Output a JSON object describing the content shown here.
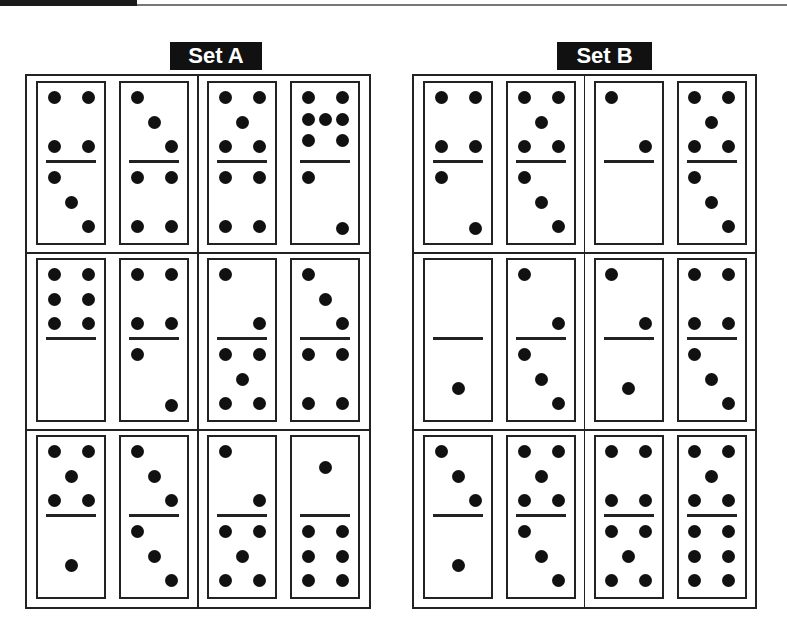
{
  "header": {
    "bar": "top-border"
  },
  "sets": [
    {
      "label": "Set A",
      "rows": [
        [
          {
            "top": 4,
            "bottom": 3
          },
          {
            "top": 3,
            "bottom": 4
          },
          {
            "top": 5,
            "bottom": 4
          },
          {
            "top": 7,
            "bottom": 2
          }
        ],
        [
          {
            "top": 6,
            "bottom": 0
          },
          {
            "top": 4,
            "bottom": 2
          },
          {
            "top": 2,
            "bottom": 5
          },
          {
            "top": 3,
            "bottom": 4
          }
        ],
        [
          {
            "top": 5,
            "bottom": 1
          },
          {
            "top": 3,
            "bottom": 3
          },
          {
            "top": 2,
            "bottom": 5
          },
          {
            "top": 1,
            "bottom": 6
          }
        ]
      ]
    },
    {
      "label": "Set B",
      "rows": [
        [
          {
            "top": 4,
            "bottom": 2
          },
          {
            "top": 5,
            "bottom": 3
          },
          {
            "top": 2,
            "bottom": 0
          },
          {
            "top": 5,
            "bottom": 3
          }
        ],
        [
          {
            "top": 0,
            "bottom": 1
          },
          {
            "top": 2,
            "bottom": 3
          },
          {
            "top": 2,
            "bottom": 1
          },
          {
            "top": 4,
            "bottom": 3
          }
        ],
        [
          {
            "top": 3,
            "bottom": 1
          },
          {
            "top": 5,
            "bottom": 3
          },
          {
            "top": 4,
            "bottom": 5
          },
          {
            "top": 5,
            "bottom": 6
          }
        ]
      ]
    }
  ]
}
